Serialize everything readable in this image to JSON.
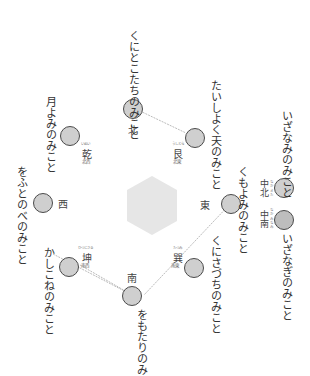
{
  "diagram": {
    "center_shape": "hexagon",
    "colors": {
      "node_fill": "#cfcfcf",
      "node_border": "#4a4a4a",
      "hexagon": "#e6e6e6",
      "line": "#aaaaaa"
    },
    "nodes": {
      "north": {
        "dir": "北",
        "deity": "くにとこたちのみこと"
      },
      "northeast": {
        "dir": "艮",
        "ruby": "うしとら",
        "sub": "北東",
        "deity": "たいしよく天のみこと"
      },
      "northwest": {
        "dir": "乾",
        "ruby": "いぬい",
        "sub": "北西",
        "deity": "月よみのみこと"
      },
      "west": {
        "dir": "西",
        "deity": "をふとのべのみこと"
      },
      "east": {
        "dir": "東",
        "deity": "くもよみのみこと"
      },
      "southwest": {
        "dir": "坤",
        "ruby": "ひつじさる",
        "sub": "南西",
        "deity": "かしこねのみこと"
      },
      "southeast": {
        "dir": "巽",
        "ruby": "たつみ",
        "sub": "南東",
        "deity": "くにさづちのみこと"
      },
      "south": {
        "dir": "南",
        "deity": "をもたりのみこと"
      },
      "center_north": {
        "dir": "中北",
        "ruby": "なか きた",
        "deity": "いざなみのみこと"
      },
      "center_south": {
        "dir": "中南",
        "ruby": "なか みなみ",
        "deity": "いざなぎのみこと"
      }
    }
  }
}
